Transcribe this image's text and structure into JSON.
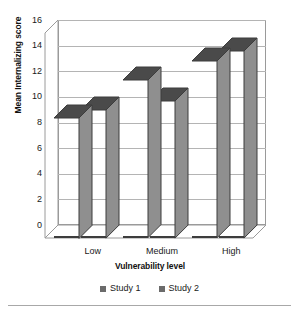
{
  "chart_data": {
    "type": "bar",
    "title": "",
    "xlabel": "Vulnerability level",
    "ylabel": "Mean Internalizing score",
    "categories": [
      "Low",
      "Medium",
      "High"
    ],
    "series": [
      {
        "name": "Study 1",
        "values": [
          9.4,
          12.3,
          13.8
        ],
        "color": "#6b6b6b"
      },
      {
        "name": "Study 2",
        "values": [
          10.0,
          10.7,
          14.6
        ],
        "color": "#6b6b6b"
      }
    ],
    "ylim": [
      0,
      16
    ],
    "ytick_step": 2,
    "yticks": [
      0,
      2,
      4,
      6,
      8,
      10,
      12,
      14,
      16
    ],
    "ytick_labels": [
      "0",
      "2",
      "4",
      "6",
      "8",
      "10",
      "12",
      "14",
      "16"
    ],
    "grid": true,
    "grid_axis": "y",
    "legend_position": "bottom",
    "three_d": true
  },
  "axes": {
    "y_title": "Mean Internalizing score",
    "x_title": "Vulnerability level"
  },
  "legend": {
    "items": [
      {
        "label": "Study 1",
        "color": "#6b6b6b"
      },
      {
        "label": "Study 2",
        "color": "#6b6b6b"
      }
    ]
  },
  "style": {
    "bar_front": "#6b6b6b",
    "bar_side": "#8f8f8f",
    "bar_top": "#4a4a4a",
    "bar_edge": "#3d3d3d",
    "gridline": "#b4b4b4",
    "frame": "#9a9a9a",
    "background": "#ffffff",
    "text": "#1a1a1a"
  }
}
